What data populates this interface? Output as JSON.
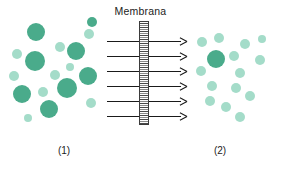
{
  "diagram": {
    "title": "Membrana",
    "left_label": "(1)",
    "right_label": "(2)",
    "colors": {
      "particle_dark": "#4aab8b",
      "particle_light": "#a4dcc9",
      "arrow": "#1a1a1a",
      "membrane_border": "#3b3b3b",
      "background": "#ffffff",
      "text": "#1c1c1c"
    }
  },
  "chart_data": {
    "type": "scatter",
    "title": "Membrana",
    "xlabel": "",
    "ylabel": "",
    "grid": false,
    "legend": null,
    "annotations": [
      "Membrana",
      "(1)",
      "(2)"
    ],
    "membrane": {
      "x": 139,
      "y": 21,
      "width": 10,
      "height": 104,
      "style": "hatched"
    },
    "arrows": {
      "count": 6,
      "direction": "left-to-right",
      "x_start": 107,
      "x_end": 187,
      "y_values": [
        41,
        56,
        71,
        86,
        101,
        116
      ]
    },
    "series": [
      {
        "name": "compartment-1-large",
        "compartment": "(1)",
        "color": "#4aab8b",
        "count": 8,
        "points": [
          {
            "x": 36,
            "y": 32,
            "r": 9
          },
          {
            "x": 76,
            "y": 51,
            "r": 9
          },
          {
            "x": 35,
            "y": 61,
            "r": 10
          },
          {
            "x": 88,
            "y": 76,
            "r": 9
          },
          {
            "x": 67,
            "y": 88,
            "r": 10
          },
          {
            "x": 22,
            "y": 94,
            "r": 9
          },
          {
            "x": 49,
            "y": 109,
            "r": 9
          },
          {
            "x": 92,
            "y": 22,
            "r": 5
          }
        ]
      },
      {
        "name": "compartment-1-small",
        "compartment": "(1)",
        "color": "#a4dcc9",
        "count": 9,
        "points": [
          {
            "x": 17,
            "y": 54,
            "r": 5
          },
          {
            "x": 60,
            "y": 47,
            "r": 5
          },
          {
            "x": 89,
            "y": 34,
            "r": 5
          },
          {
            "x": 14,
            "y": 76,
            "r": 5
          },
          {
            "x": 55,
            "y": 75,
            "r": 5
          },
          {
            "x": 43,
            "y": 92,
            "r": 5
          },
          {
            "x": 91,
            "y": 103,
            "r": 5
          },
          {
            "x": 70,
            "y": 67,
            "r": 4
          },
          {
            "x": 28,
            "y": 118,
            "r": 4
          }
        ]
      },
      {
        "name": "compartment-2-large",
        "compartment": "(2)",
        "color": "#4aab8b",
        "count": 1,
        "points": [
          {
            "x": 216,
            "y": 59,
            "r": 9
          }
        ]
      },
      {
        "name": "compartment-2-small",
        "compartment": "(2)",
        "color": "#a4dcc9",
        "count": 14,
        "points": [
          {
            "x": 202,
            "y": 42,
            "r": 5
          },
          {
            "x": 219,
            "y": 38,
            "r": 5
          },
          {
            "x": 245,
            "y": 44,
            "r": 5
          },
          {
            "x": 262,
            "y": 39,
            "r": 4
          },
          {
            "x": 234,
            "y": 56,
            "r": 5
          },
          {
            "x": 260,
            "y": 60,
            "r": 5
          },
          {
            "x": 201,
            "y": 71,
            "r": 5
          },
          {
            "x": 240,
            "y": 73,
            "r": 5
          },
          {
            "x": 212,
            "y": 86,
            "r": 5
          },
          {
            "x": 236,
            "y": 88,
            "r": 5
          },
          {
            "x": 250,
            "y": 96,
            "r": 5
          },
          {
            "x": 210,
            "y": 101,
            "r": 5
          },
          {
            "x": 226,
            "y": 107,
            "r": 5
          },
          {
            "x": 240,
            "y": 117,
            "r": 5
          }
        ]
      }
    ]
  }
}
